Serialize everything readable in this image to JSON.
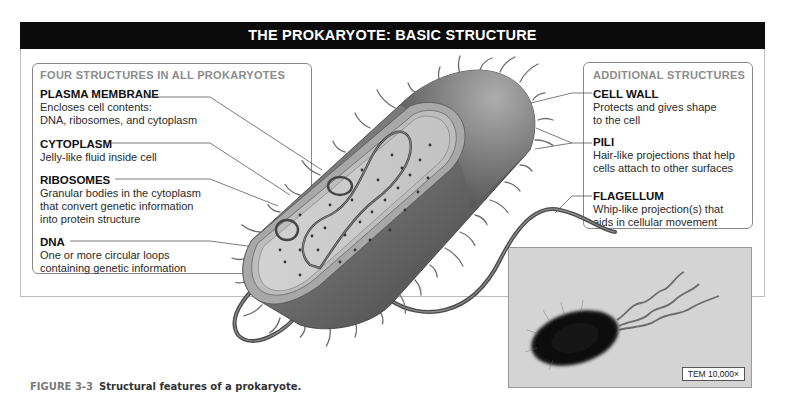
{
  "title": "THE PROKARYOTE: BASIC STRUCTURE",
  "left_box": {
    "heading": "FOUR STRUCTURES IN ALL PROKARYOTES",
    "items": [
      {
        "title": "PLASMA MEMBRANE",
        "desc": [
          "Encloses cell contents:",
          "DNA, ribosomes, and cytoplasm"
        ]
      },
      {
        "title": "CYTOPLASM",
        "desc": [
          "Jelly-like fluid inside cell"
        ]
      },
      {
        "title": "RIBOSOMES",
        "desc": [
          "Granular bodies in the cytoplasm",
          "that convert genetic information",
          "into protein structure"
        ]
      },
      {
        "title": "DNA",
        "desc": [
          "One or more circular loops",
          "containing genetic information"
        ]
      }
    ]
  },
  "right_box": {
    "heading": "ADDITIONAL STRUCTURES",
    "items": [
      {
        "title": "CELL WALL",
        "desc": [
          "Protects and gives shape",
          "to the cell"
        ]
      },
      {
        "title": "PILI",
        "desc": [
          "Hair-like projections that help",
          "cells attach to other surfaces"
        ]
      },
      {
        "title": "FLAGELLUM",
        "desc": [
          "Whip-like projection(s) that",
          "aids in cellular movement"
        ]
      }
    ]
  },
  "photo": {
    "label": "TEM 10,000×"
  },
  "caption": {
    "number": "FIGURE 3-3",
    "text": "Structural features of a prokaryote."
  },
  "colors": {
    "title_bar": "#0b0b0b",
    "heading_gray": "#8c8c8c",
    "cell_body": "#6e6e6e",
    "cytoplasm": "#c9c9c9"
  }
}
